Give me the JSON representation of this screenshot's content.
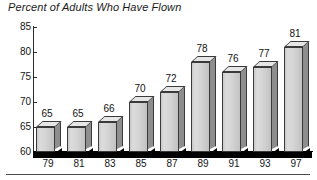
{
  "chart_data": {
    "type": "bar",
    "title": "Percent of Adults Who Have Flown",
    "xlabel": "",
    "ylabel": "",
    "categories": [
      "79",
      "81",
      "83",
      "85",
      "87",
      "89",
      "91",
      "93",
      "97"
    ],
    "values": [
      65,
      65,
      66,
      70,
      72,
      78,
      76,
      77,
      81
    ],
    "ylim": [
      60,
      85
    ],
    "yticks": [
      60,
      65,
      70,
      75,
      80,
      85
    ],
    "ytick_labels": [
      "60",
      "65",
      "70",
      "75",
      "80",
      "85"
    ],
    "grid": false,
    "legend": null,
    "data_labels": [
      "65",
      "65",
      "66",
      "70",
      "72",
      "78",
      "76",
      "77",
      "81"
    ],
    "style": "3d-bars",
    "colors": {
      "bar_front": "#d2d2d2",
      "bar_side": "#8e8e8e",
      "bar_top": "#e6e6e6",
      "bar_outline": "#3a3a3a",
      "floor": "#000000",
      "axis": "#2b2b2b",
      "text": "#151515",
      "background": "#ffffff"
    }
  }
}
